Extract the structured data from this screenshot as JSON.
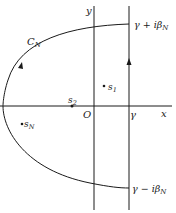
{
  "diagram": {
    "type": "complex-plane contour",
    "axes": {
      "x_label": "x",
      "y_label": "y",
      "origin_label": "O"
    },
    "vertical_line": {
      "label": "γ",
      "top_label": "γ + iβ",
      "top_label_sub": "N",
      "bottom_label": "γ − iβ",
      "bottom_label_sub": "N"
    },
    "contour": {
      "label": "C",
      "label_sub": "N"
    },
    "points": [
      {
        "label": "s",
        "sub": "1"
      },
      {
        "label": "s",
        "sub": "2"
      },
      {
        "label": "s",
        "sub": "N"
      }
    ],
    "colors": {
      "line": "#1a1a1a",
      "background": "#ffffff"
    }
  }
}
